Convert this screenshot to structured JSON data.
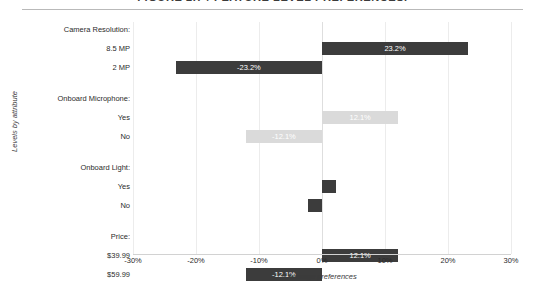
{
  "title": "FIGURE 2.7 / FEATURE LEVEL PREFERENCES.",
  "colors": {
    "bar_dark": "#3c3c3c",
    "bar_light": "#dadada",
    "gridline": "#ececec",
    "axis": "#d2d2d2",
    "text": "#2b2b2b"
  },
  "chart_data": {
    "type": "bar",
    "orientation": "horizontal",
    "title": "FIGURE 2.7 / FEATURE LEVEL PREFERENCES.",
    "xlabel": "Average preferences",
    "ylabel": "Levels by attribute",
    "xlim": [
      -30,
      30
    ],
    "xticks": [
      -30,
      -20,
      -10,
      0,
      10,
      20,
      30
    ],
    "xtick_labels": [
      "-30%",
      "-20%",
      "-10%",
      "0%",
      "10%",
      "20%",
      "30%"
    ],
    "grid": true,
    "legend": "none",
    "groups": [
      {
        "name": "Camera Resolution:",
        "levels": [
          {
            "label": "8.5 MP",
            "value": 23.2,
            "value_label": "23.2%",
            "shade": "dark",
            "show_label": true
          },
          {
            "label": "2 MP",
            "value": -23.2,
            "value_label": "-23.2%",
            "shade": "dark",
            "show_label": true
          }
        ]
      },
      {
        "name": "Onboard Microphone:",
        "levels": [
          {
            "label": "Yes",
            "value": 12.1,
            "value_label": "12.1%",
            "shade": "light",
            "show_label": true
          },
          {
            "label": "No",
            "value": -12.1,
            "value_label": "-12.1%",
            "shade": "light",
            "show_label": true
          }
        ]
      },
      {
        "name": "Onboard Light:",
        "levels": [
          {
            "label": "Yes",
            "value": 2.2,
            "value_label": "2.2%",
            "shade": "dark",
            "show_label": false
          },
          {
            "label": "No",
            "value": -2.2,
            "value_label": "-2.2%",
            "shade": "dark",
            "show_label": false
          }
        ]
      },
      {
        "name": "Price:",
        "levels": [
          {
            "label": "$39.99",
            "value": 12.1,
            "value_label": "12.1%",
            "shade": "dark",
            "show_label": true
          },
          {
            "label": "$59.99",
            "value": -12.1,
            "value_label": "-12.1%",
            "shade": "dark",
            "show_label": true
          }
        ]
      }
    ]
  }
}
